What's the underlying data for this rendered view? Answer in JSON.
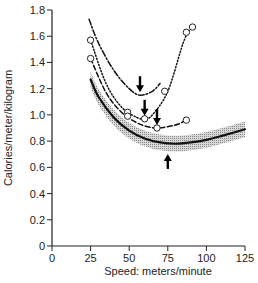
{
  "chart_data": {
    "type": "line",
    "title": "",
    "xlabel": "Speed: meters/minute",
    "ylabel": "Calories/meter/kilogram",
    "xlim": [
      0,
      125
    ],
    "ylim": [
      0,
      1.8
    ],
    "x_ticks": [
      "0",
      "25",
      "50",
      "75",
      "100",
      "125"
    ],
    "y_ticks": [
      "0",
      "0.2",
      "0.4",
      "0.6",
      "0.8",
      "1.0",
      "1.2",
      "1.4",
      "1.6",
      "1.8"
    ],
    "grid": false,
    "legend": "none",
    "series": [
      {
        "name": "reference curve (solid, shaded band)",
        "style": "solid",
        "x": [
          25,
          30,
          40,
          50,
          60,
          70,
          80,
          90,
          100,
          110,
          125
        ],
        "y": [
          1.27,
          1.14,
          0.98,
          0.88,
          0.82,
          0.79,
          0.78,
          0.79,
          0.81,
          0.84,
          0.89
        ],
        "band": 0.06,
        "minimum_arrow_x": 75
      },
      {
        "name": "dash-dot curve",
        "style": "dashdot",
        "x": [
          24,
          30,
          40,
          50,
          57,
          65,
          70
        ],
        "y": [
          1.73,
          1.55,
          1.34,
          1.2,
          1.15,
          1.18,
          1.24
        ],
        "minimum_arrow_x": 57
      },
      {
        "name": "dotted curve",
        "style": "dotted",
        "points": [
          [
            25,
            1.57
          ],
          [
            49,
            1.02
          ],
          [
            60,
            0.97
          ],
          [
            73,
            1.18
          ],
          [
            87,
            1.63
          ],
          [
            91,
            1.67
          ]
        ],
        "x": [
          25,
          35,
          45,
          55,
          60,
          65,
          75,
          85,
          90
        ],
        "y": [
          1.57,
          1.24,
          1.06,
          0.98,
          0.97,
          1.0,
          1.18,
          1.55,
          1.66
        ],
        "minimum_arrow_x": 60
      },
      {
        "name": "dashed curve",
        "style": "dashed",
        "points": [
          [
            25,
            1.43
          ],
          [
            49,
            0.99
          ],
          [
            68,
            0.9
          ],
          [
            87,
            0.96
          ]
        ],
        "x": [
          25,
          35,
          45,
          55,
          62,
          68,
          75,
          82,
          88
        ],
        "y": [
          1.43,
          1.17,
          1.02,
          0.94,
          0.91,
          0.9,
          0.91,
          0.93,
          0.97
        ],
        "minimum_arrow_x": 68
      }
    ]
  }
}
